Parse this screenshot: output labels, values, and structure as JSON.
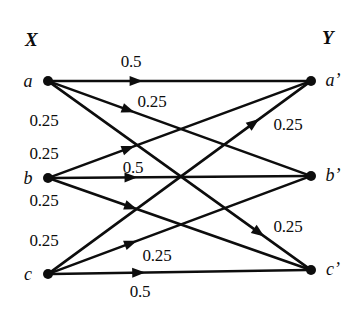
{
  "figure": {
    "background_color": "#ffffff",
    "ink_color": "#0d0d0d",
    "width": 364,
    "height": 311
  },
  "sets": {
    "left": {
      "label": "X",
      "x": 25,
      "y": 30
    },
    "right": {
      "label": "Y",
      "x": 322,
      "y": 28
    }
  },
  "nodes": {
    "left": [
      {
        "id": "a",
        "label": "a",
        "cx": 48,
        "cy": 81,
        "label_x": 28,
        "label_y": 81,
        "r": 5
      },
      {
        "id": "b",
        "label": "b",
        "cx": 48,
        "cy": 178,
        "label_x": 28,
        "label_y": 178,
        "r": 5
      },
      {
        "id": "c",
        "label": "c",
        "cx": 48,
        "cy": 274,
        "label_x": 28,
        "label_y": 274,
        "r": 5
      }
    ],
    "right": [
      {
        "id": "ap",
        "label": "a’",
        "cx": 311,
        "cy": 81,
        "label_x": 333,
        "label_y": 80,
        "r": 5
      },
      {
        "id": "bp",
        "label": "b’",
        "cx": 311,
        "cy": 176,
        "label_x": 333,
        "label_y": 175,
        "r": 5
      },
      {
        "id": "cp",
        "label": "c’",
        "cx": 311,
        "cy": 270,
        "label_x": 333,
        "label_y": 269,
        "r": 5
      }
    ]
  },
  "edges": [
    {
      "id": "a-ap",
      "from": "a",
      "to": "ap",
      "weight": "0.5",
      "x1": 48,
      "y1": 81,
      "x2": 311,
      "y2": 81,
      "arrow_t": 0.33
    },
    {
      "id": "a-bp",
      "from": "a",
      "to": "bp",
      "weight": "0.25",
      "x1": 48,
      "y1": 81,
      "x2": 311,
      "y2": 176,
      "arrow_t": 0.3
    },
    {
      "id": "a-cp",
      "from": "a",
      "to": "cp",
      "weight": "0.25",
      "x1": 48,
      "y1": 81,
      "x2": 311,
      "y2": 270,
      "arrow_t": 0.81
    },
    {
      "id": "b-ap",
      "from": "b",
      "to": "ap",
      "weight": "0.25",
      "x1": 48,
      "y1": 178,
      "x2": 311,
      "y2": 81,
      "arrow_t": 0.3
    },
    {
      "id": "b-bp",
      "from": "b",
      "to": "bp",
      "weight": "0.5",
      "x1": 48,
      "y1": 178,
      "x2": 311,
      "y2": 176,
      "arrow_t": 0.31
    },
    {
      "id": "b-cp",
      "from": "b",
      "to": "cp",
      "weight": "0.25",
      "x1": 48,
      "y1": 178,
      "x2": 311,
      "y2": 270,
      "arrow_t": 0.31
    },
    {
      "id": "c-ap",
      "from": "c",
      "to": "ap",
      "weight": "0.25",
      "x1": 48,
      "y1": 274,
      "x2": 311,
      "y2": 81,
      "arrow_t": 0.79
    },
    {
      "id": "c-bp",
      "from": "c",
      "to": "bp",
      "weight": "0.25",
      "x1": 48,
      "y1": 274,
      "x2": 311,
      "y2": 176,
      "arrow_t": 0.31
    },
    {
      "id": "c-cp",
      "from": "c",
      "to": "cp",
      "weight": "0.5",
      "x1": 48,
      "y1": 274,
      "x2": 311,
      "y2": 270,
      "arrow_t": 0.34
    }
  ],
  "weight_labels": [
    {
      "id": "w-a-ap",
      "text": "0.5",
      "x": 131,
      "y": 61,
      "edge": "a-ap"
    },
    {
      "id": "w-a-bp",
      "text": "0.25",
      "x": 152,
      "y": 101,
      "edge": "a-bp"
    },
    {
      "id": "w-a-cp",
      "text": "0.25",
      "x": 44,
      "y": 120,
      "edge": "a-cp"
    },
    {
      "id": "w-b-ap",
      "text": "0.25",
      "x": 44,
      "y": 153,
      "edge": "b-ap"
    },
    {
      "id": "w-b-bp",
      "text": "0.5",
      "x": 133,
      "y": 167,
      "edge": "b-bp"
    },
    {
      "id": "w-b-cp",
      "text": "0.25",
      "x": 44,
      "y": 200,
      "edge": "b-cp"
    },
    {
      "id": "w-c-ap",
      "text": "0.25",
      "x": 44,
      "y": 240,
      "edge": "c-ap"
    },
    {
      "id": "w-c-ap2",
      "text": "0.25",
      "x": 288,
      "y": 124,
      "edge": "c-ap"
    },
    {
      "id": "w-c-bp",
      "text": "0.25",
      "x": 288,
      "y": 226,
      "edge": "c-bp"
    },
    {
      "id": "w-c-bp2",
      "text": "0.25",
      "x": 157,
      "y": 255,
      "edge": "c-bp"
    },
    {
      "id": "w-c-cp",
      "text": "0.5",
      "x": 140,
      "y": 291,
      "edge": "c-cp"
    }
  ],
  "chart_data": {
    "type": "diagram",
    "source_nodes": [
      "a",
      "b",
      "c"
    ],
    "target_nodes": [
      "a’",
      "b’",
      "c’"
    ],
    "transitions": [
      {
        "from": "a",
        "to": "a’",
        "probability": 0.5
      },
      {
        "from": "a",
        "to": "b’",
        "probability": 0.25
      },
      {
        "from": "a",
        "to": "c’",
        "probability": 0.25
      },
      {
        "from": "b",
        "to": "a’",
        "probability": 0.25
      },
      {
        "from": "b",
        "to": "b’",
        "probability": 0.5
      },
      {
        "from": "b",
        "to": "c’",
        "probability": 0.25
      },
      {
        "from": "c",
        "to": "a’",
        "probability": 0.25
      },
      {
        "from": "c",
        "to": "b’",
        "probability": 0.25
      },
      {
        "from": "c",
        "to": "c’",
        "probability": 0.5
      }
    ]
  }
}
